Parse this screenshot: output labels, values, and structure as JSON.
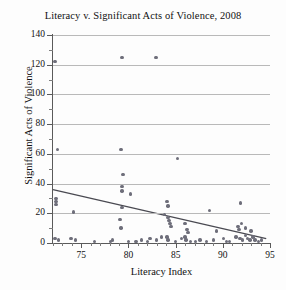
{
  "chart_data": {
    "type": "scatter",
    "title": "Literacy v. Significant Acts of Violence, 2008",
    "xlabel": "Literacy Index",
    "ylabel": "Significant Acts of Violence",
    "xlim": [
      72,
      95
    ],
    "ylim": [
      0,
      140
    ],
    "xticks": [
      75,
      80,
      85,
      90,
      95
    ],
    "yticks": [
      0,
      20,
      40,
      60,
      80,
      100,
      120,
      140
    ],
    "grid": true,
    "legend": "none",
    "marker_color": "#6e6e7a",
    "trendline_color": "#4a4a52",
    "series": [
      {
        "name": "Countries",
        "points": [
          [
            72.2,
            122
          ],
          [
            79.3,
            125
          ],
          [
            82.9,
            125
          ],
          [
            72.5,
            63
          ],
          [
            79.2,
            63
          ],
          [
            85.2,
            57
          ],
          [
            79.4,
            46
          ],
          [
            79.3,
            38
          ],
          [
            79.3,
            35
          ],
          [
            80.2,
            33
          ],
          [
            72.3,
            30
          ],
          [
            72.3,
            28
          ],
          [
            72.3,
            26
          ],
          [
            79.3,
            24
          ],
          [
            84.1,
            28
          ],
          [
            84.2,
            25
          ],
          [
            88.6,
            22
          ],
          [
            91.9,
            27
          ],
          [
            74.2,
            21
          ],
          [
            79.1,
            16
          ],
          [
            83.8,
            19
          ],
          [
            84.2,
            17
          ],
          [
            84.3,
            15
          ],
          [
            84.4,
            13
          ],
          [
            84.5,
            11
          ],
          [
            86.0,
            13
          ],
          [
            79.2,
            10
          ],
          [
            86.2,
            9
          ],
          [
            86.3,
            7
          ],
          [
            89.3,
            8
          ],
          [
            91.6,
            11
          ],
          [
            91.7,
            9
          ],
          [
            92.0,
            13
          ],
          [
            92.4,
            10
          ],
          [
            93.0,
            8
          ],
          [
            72.2,
            3
          ],
          [
            72.6,
            2
          ],
          [
            73.9,
            3
          ],
          [
            74.4,
            2
          ],
          [
            76.4,
            1
          ],
          [
            78.1,
            1
          ],
          [
            80.0,
            1
          ],
          [
            81.4,
            2
          ],
          [
            82.3,
            3
          ],
          [
            83.0,
            2
          ],
          [
            83.5,
            4
          ],
          [
            84.1,
            4
          ],
          [
            84.2,
            2
          ],
          [
            85.0,
            1
          ],
          [
            85.6,
            3
          ],
          [
            86.0,
            4
          ],
          [
            86.1,
            2
          ],
          [
            86.6,
            1
          ],
          [
            87.6,
            2
          ],
          [
            88.3,
            1
          ],
          [
            89.0,
            2
          ],
          [
            90.1,
            3
          ],
          [
            90.7,
            1
          ],
          [
            91.4,
            4
          ],
          [
            91.8,
            3
          ],
          [
            92.1,
            2
          ],
          [
            92.4,
            5
          ],
          [
            92.6,
            3
          ],
          [
            92.9,
            2
          ],
          [
            93.2,
            4
          ],
          [
            93.4,
            2
          ],
          [
            93.8,
            1
          ],
          [
            94.1,
            2
          ],
          [
            78.3,
            2
          ],
          [
            80.8,
            1
          ],
          [
            82.0,
            1
          ],
          [
            87.1,
            1
          ],
          [
            90.4,
            1
          ]
        ]
      }
    ],
    "trendline": {
      "x_start": 72,
      "y_start": 36,
      "x_end": 94.6,
      "y_end": 3
    }
  }
}
